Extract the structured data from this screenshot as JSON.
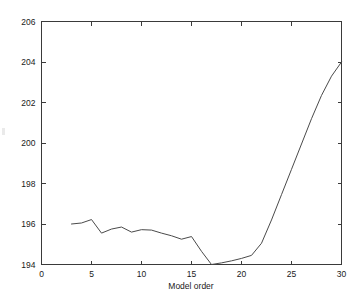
{
  "chart_data": {
    "type": "line",
    "title": "",
    "xlabel": "Model order",
    "ylabel": "",
    "xlim": [
      0,
      30
    ],
    "ylim": [
      194,
      206
    ],
    "xticks": [
      0,
      5,
      10,
      15,
      20,
      25,
      30
    ],
    "yticks": [
      194,
      196,
      198,
      200,
      202,
      204,
      206
    ],
    "xtick_labels": [
      "0",
      "5",
      "10",
      "15",
      "20",
      "25",
      "30"
    ],
    "ytick_labels": [
      "194",
      "196",
      "198",
      "200",
      "202",
      "204",
      "206"
    ],
    "grid": false,
    "legend": null,
    "tick_direction": "in",
    "line_color": "#4a4a4a",
    "background_color": "#ffffff",
    "series": [
      {
        "name": "criterion",
        "x": [
          3,
          4,
          5,
          6,
          7,
          8,
          9,
          10,
          11,
          12,
          13,
          14,
          15,
          16,
          17,
          18,
          19,
          20,
          21,
          22,
          23,
          24,
          25,
          26,
          27,
          28,
          29,
          30
        ],
        "values": [
          196.0,
          196.05,
          196.22,
          195.55,
          195.75,
          195.85,
          195.6,
          195.72,
          195.7,
          195.55,
          195.42,
          195.25,
          195.38,
          194.65,
          194.0,
          194.08,
          194.18,
          194.3,
          194.45,
          195.05,
          196.2,
          197.45,
          198.7,
          199.95,
          201.2,
          202.35,
          203.3,
          204.0
        ]
      }
    ]
  },
  "figure": {
    "axis_color": "#3a3a3a"
  }
}
